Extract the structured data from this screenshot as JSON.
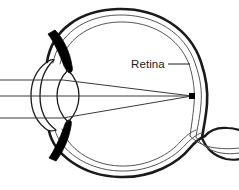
{
  "diagram": {
    "background_color": "#ffffff",
    "stroke_color": "#1a1a1a",
    "fill_black": "#000000",
    "ray_color": "#3a3a3a",
    "labels": [
      {
        "id": "retina",
        "text": "Retina",
        "x": 131,
        "y": 68,
        "leader_line": {
          "x1": 168,
          "y1": 64,
          "x2": 190,
          "y2": 64
        }
      }
    ],
    "structures": [
      {
        "name": "sclera-outer-wall",
        "description": "thick outer arc of the eyeball"
      },
      {
        "name": "choroid-middle-wall",
        "description": "thin middle arc layer"
      },
      {
        "name": "retina-inner-wall",
        "description": "thin innermost arc layer"
      },
      {
        "name": "cornea",
        "description": "double curved arc at the front of the eye"
      },
      {
        "name": "lens",
        "description": "biconvex ellipse behind the cornea"
      },
      {
        "name": "iris-upper",
        "description": "solid black wedge above the lens"
      },
      {
        "name": "iris-lower",
        "description": "solid black wedge below the lens"
      },
      {
        "name": "optic-nerve",
        "description": "sheath curving away at lower right"
      },
      {
        "name": "focal-point",
        "description": "black dot on the retina where rays converge"
      }
    ],
    "light_rays": {
      "count": 3,
      "entry_y_positions": [
        80,
        96,
        118
      ],
      "focal_point": {
        "x": 192,
        "y": 96
      }
    }
  }
}
